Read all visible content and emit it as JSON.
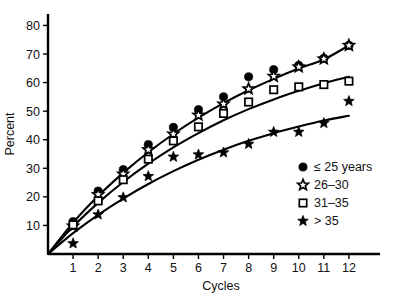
{
  "chart_data": {
    "type": "line",
    "title": "",
    "xlabel": "Cycles",
    "ylabel": "Percent",
    "xlim": [
      0,
      13
    ],
    "ylim": [
      0,
      84
    ],
    "grid": false,
    "legend_position": "right-inside",
    "x_ticks": [
      1,
      2,
      3,
      4,
      5,
      6,
      7,
      8,
      9,
      10,
      11,
      12
    ],
    "y_ticks": [
      10,
      20,
      30,
      40,
      50,
      60,
      70,
      80
    ],
    "x": [
      1,
      2,
      3,
      4,
      5,
      6,
      7,
      8,
      9,
      10,
      11,
      12
    ],
    "series": [
      {
        "name": "≤ 25 years",
        "marker": "filled-circle",
        "values": [
          11.3,
          22.0,
          29.5,
          38.3,
          44.3,
          50.5,
          55.0,
          62.0,
          64.5,
          66.0,
          68.5,
          73.0
        ],
        "fit_curve": [
          [
            0,
            0
          ],
          [
            1,
            11.0
          ],
          [
            2,
            20.3
          ],
          [
            3,
            28.4
          ],
          [
            4,
            35.6
          ],
          [
            5,
            42.0
          ],
          [
            6,
            47.7
          ],
          [
            7,
            52.8
          ],
          [
            8,
            57.3
          ],
          [
            9,
            61.3
          ],
          [
            10,
            64.9
          ],
          [
            11,
            68.1
          ],
          [
            12,
            73.0
          ]
        ]
      },
      {
        "name": "26–30",
        "marker": "open-star",
        "values": [
          9.8,
          20.8,
          28.0,
          36.5,
          42.0,
          48.6,
          52.5,
          57.8,
          62.2,
          65.5,
          68.3,
          73.0
        ],
        "fit_curve": null
      },
      {
        "name": "31–35",
        "marker": "open-square",
        "values": [
          10.2,
          18.6,
          26.0,
          33.2,
          39.6,
          44.5,
          49.2,
          53.2,
          57.5,
          58.5,
          59.3,
          60.5
        ],
        "fit_curve": [
          [
            0,
            0
          ],
          [
            1,
            9.6
          ],
          [
            2,
            17.9
          ],
          [
            3,
            25.2
          ],
          [
            4,
            31.6
          ],
          [
            5,
            37.3
          ],
          [
            6,
            42.3
          ],
          [
            7,
            46.8
          ],
          [
            8,
            50.7
          ],
          [
            9,
            54.1
          ],
          [
            10,
            57.1
          ],
          [
            11,
            59.8
          ],
          [
            12,
            62.0
          ]
        ]
      },
      {
        "name": "> 35",
        "marker": "filled-star",
        "values": [
          3.7,
          13.8,
          19.8,
          27.2,
          34.0,
          34.8,
          35.5,
          38.5,
          42.7,
          42.7,
          45.8,
          53.5
        ],
        "fit_curve": [
          [
            0,
            0
          ],
          [
            1,
            7.3
          ],
          [
            2,
            13.7
          ],
          [
            3,
            19.4
          ],
          [
            4,
            24.5
          ],
          [
            5,
            29.0
          ],
          [
            6,
            33.0
          ],
          [
            7,
            36.5
          ],
          [
            8,
            39.6
          ],
          [
            9,
            42.3
          ],
          [
            10,
            44.6
          ],
          [
            11,
            46.7
          ],
          [
            12,
            48.4
          ]
        ]
      }
    ],
    "legend": [
      {
        "label": "≤ 25 years",
        "marker": "filled-circle"
      },
      {
        "label": "26–30",
        "marker": "open-star"
      },
      {
        "label": "31–35",
        "marker": "open-square"
      },
      {
        "label": "> 35",
        "marker": "filled-star"
      }
    ]
  }
}
